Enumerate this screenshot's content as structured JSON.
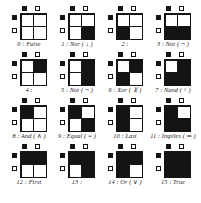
{
  "figure": {
    "marker_legend": {
      "filled_label": "true",
      "empty_label": "false"
    },
    "cells": [
      {
        "index": 0,
        "caption": "0 : False",
        "name": "False",
        "symbol": "",
        "col_markers": [
          "filled",
          "empty"
        ],
        "row_markers": [
          "filled",
          "empty"
        ],
        "matrix": [
          [
            0,
            0
          ],
          [
            0,
            0
          ]
        ]
      },
      {
        "index": 1,
        "caption": "1 : Nor ( ↓ )",
        "name": "Nor",
        "symbol": "↓",
        "col_markers": [
          "filled",
          "empty"
        ],
        "row_markers": [
          "filled",
          "empty"
        ],
        "matrix": [
          [
            0,
            0
          ],
          [
            0,
            1
          ]
        ]
      },
      {
        "index": 2,
        "caption": "2 :",
        "name": "",
        "symbol": "",
        "col_markers": [
          "filled",
          "empty"
        ],
        "row_markers": [
          "filled",
          "empty"
        ],
        "matrix": [
          [
            0,
            0
          ],
          [
            1,
            0
          ]
        ]
      },
      {
        "index": 3,
        "caption": "3 : Not ( ¬ )",
        "name": "Not",
        "symbol": "¬",
        "col_markers": [
          "filled",
          "empty"
        ],
        "row_markers": [
          "filled",
          "empty"
        ],
        "matrix": [
          [
            0,
            0
          ],
          [
            1,
            1
          ]
        ]
      },
      {
        "index": 4,
        "caption": "4 :",
        "name": "",
        "symbol": "",
        "col_markers": [
          "filled",
          "empty"
        ],
        "row_markers": [
          "filled",
          "empty"
        ],
        "matrix": [
          [
            0,
            1
          ],
          [
            0,
            0
          ]
        ]
      },
      {
        "index": 5,
        "caption": "5 : Not ( ¬ )",
        "name": "Not",
        "symbol": "¬",
        "col_markers": [
          "filled",
          "empty"
        ],
        "row_markers": [
          "filled",
          "empty"
        ],
        "matrix": [
          [
            0,
            1
          ],
          [
            0,
            1
          ]
        ]
      },
      {
        "index": 6,
        "caption": "6 : Xor ( ⊻ )",
        "name": "Xor",
        "symbol": "⊻",
        "col_markers": [
          "filled",
          "empty"
        ],
        "row_markers": [
          "filled",
          "empty"
        ],
        "matrix": [
          [
            0,
            1
          ],
          [
            1,
            0
          ]
        ]
      },
      {
        "index": 7,
        "caption": "7 : Nand ( ↑ )",
        "name": "Nand",
        "symbol": "↑",
        "col_markers": [
          "filled",
          "empty"
        ],
        "row_markers": [
          "filled",
          "empty"
        ],
        "matrix": [
          [
            0,
            1
          ],
          [
            1,
            1
          ]
        ]
      },
      {
        "index": 8,
        "caption": "8 : And ( ∧ )",
        "name": "And",
        "symbol": "∧",
        "col_markers": [
          "filled",
          "empty"
        ],
        "row_markers": [
          "filled",
          "empty"
        ],
        "matrix": [
          [
            1,
            0
          ],
          [
            0,
            0
          ]
        ]
      },
      {
        "index": 9,
        "caption": "9 : Equal ( = )",
        "name": "Equal",
        "symbol": "=",
        "col_markers": [
          "filled",
          "empty"
        ],
        "row_markers": [
          "filled",
          "empty"
        ],
        "matrix": [
          [
            1,
            0
          ],
          [
            0,
            1
          ]
        ]
      },
      {
        "index": 10,
        "caption": "10 : Last",
        "name": "Last",
        "symbol": "",
        "col_markers": [
          "filled",
          "empty"
        ],
        "row_markers": [
          "filled",
          "empty"
        ],
        "matrix": [
          [
            1,
            0
          ],
          [
            1,
            0
          ]
        ]
      },
      {
        "index": 11,
        "caption": "11 : Implies ( ⇒ )",
        "name": "Implies",
        "symbol": "⇒",
        "col_markers": [
          "filled",
          "empty"
        ],
        "row_markers": [
          "filled",
          "empty"
        ],
        "matrix": [
          [
            1,
            0
          ],
          [
            1,
            1
          ]
        ]
      },
      {
        "index": 12,
        "caption": "12 : First",
        "name": "First",
        "symbol": "",
        "col_markers": [
          "filled",
          "empty"
        ],
        "row_markers": [
          "filled",
          "empty"
        ],
        "matrix": [
          [
            1,
            1
          ],
          [
            0,
            0
          ]
        ]
      },
      {
        "index": 13,
        "caption": "13 :",
        "name": "",
        "symbol": "",
        "col_markers": [
          "filled",
          "empty"
        ],
        "row_markers": [
          "filled",
          "empty"
        ],
        "matrix": [
          [
            1,
            1
          ],
          [
            0,
            1
          ]
        ]
      },
      {
        "index": 14,
        "caption": "14 : Or ( ∨ )",
        "name": "Or",
        "symbol": "∨",
        "col_markers": [
          "filled",
          "empty"
        ],
        "row_markers": [
          "filled",
          "empty"
        ],
        "matrix": [
          [
            1,
            1
          ],
          [
            1,
            0
          ]
        ]
      },
      {
        "index": 15,
        "caption": "15 : True",
        "name": "True",
        "symbol": "",
        "col_markers": [
          "filled",
          "empty"
        ],
        "row_markers": [
          "filled",
          "empty"
        ],
        "matrix": [
          [
            1,
            1
          ],
          [
            1,
            1
          ]
        ]
      }
    ],
    "colors": {
      "ink": "#141414",
      "paper": "#ffffff"
    }
  }
}
